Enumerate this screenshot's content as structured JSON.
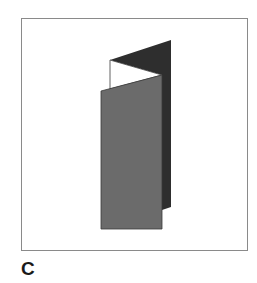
{
  "figure": {
    "label": "C",
    "colors": {
      "front_panel": "#6b6b6b",
      "back_panel": "#2e2e2e",
      "inner_panel": "#ffffff",
      "frame_border": "#8a8a8a"
    }
  }
}
